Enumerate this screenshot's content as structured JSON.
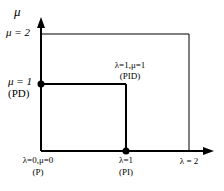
{
  "diagram": {
    "type": "parameter-plane",
    "axes": {
      "x_label": "λ",
      "y_label": "μ"
    },
    "labels": {
      "y_axis": "μ",
      "mu2": "μ = 2",
      "mu1": "μ = 1",
      "pd": "(PD)",
      "pid_top": "λ=1,μ=1",
      "pid_bottom": "(PID)",
      "origin_top": "λ=0,μ=0",
      "origin_bottom": "(P)",
      "lam1_top": "λ=1",
      "lam1_bottom": "(PI)",
      "lam2": "λ = 2"
    },
    "points": [
      {
        "name": "P",
        "lambda": 0,
        "mu": 0
      },
      {
        "name": "PI",
        "lambda": 1,
        "mu": 0
      },
      {
        "name": "PD",
        "lambda": 0,
        "mu": 1
      },
      {
        "name": "PID",
        "lambda": 1,
        "mu": 1
      }
    ],
    "regions": [
      {
        "name": "inner-square",
        "lambda_max": 1,
        "mu_max": 1
      },
      {
        "name": "outer-square",
        "lambda_max": 2,
        "mu_max": 2
      }
    ]
  }
}
